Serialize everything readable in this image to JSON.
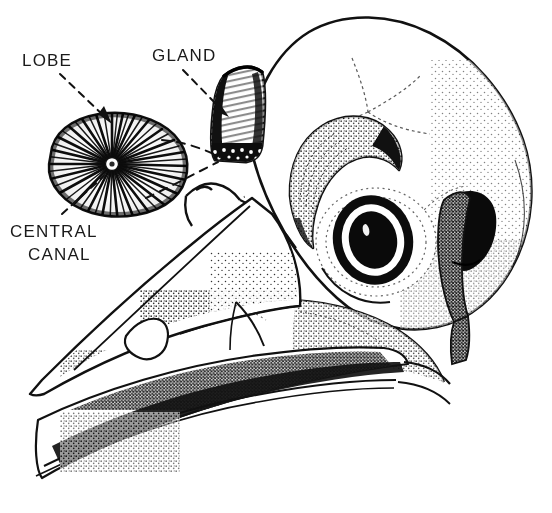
{
  "figure": {
    "background_color": "#ffffff",
    "ink_color": "#111111",
    "width": 552,
    "height": 513,
    "style": "pen-and-ink stipple scientific illustration"
  },
  "labels": {
    "lobe": "LOBE",
    "gland": "GLAND",
    "central": "CENTRAL",
    "canal": "CANAL"
  },
  "annotations": [
    {
      "name": "lobe-leader",
      "label": "LOBE",
      "type": "dashed-arrow",
      "from": [
        60,
        74
      ],
      "to": [
        110,
        120
      ],
      "target": "gland-lobe-cross-section"
    },
    {
      "name": "gland-leader",
      "label": "GLAND",
      "type": "dashed-arrow",
      "from": [
        185,
        70
      ],
      "to": [
        225,
        112
      ],
      "target": "nasal-salt-gland"
    },
    {
      "name": "central-canal-leader",
      "label": "CENTRAL CANAL",
      "type": "dashed-line",
      "from": [
        60,
        214
      ],
      "to": [
        104,
        178
      ],
      "target": "central-canal-point"
    },
    {
      "name": "lobe-to-gland-upper-link",
      "type": "dashed-line",
      "from": [
        160,
        142
      ],
      "to": [
        222,
        158
      ],
      "target": "nasal-salt-gland-base"
    },
    {
      "name": "lobe-to-gland-lower-link",
      "type": "dashed-line",
      "from": [
        148,
        196
      ],
      "to": [
        222,
        162
      ],
      "target": "nasal-salt-gland-base"
    }
  ],
  "anatomy": [
    {
      "name": "cranium",
      "description": "rounded braincase dome with suture lines"
    },
    {
      "name": "nasal-salt-gland",
      "description": "tapered supraorbital gland sitting in the nasal groove"
    },
    {
      "name": "gland-lobe-cross-section",
      "description": "ovoid section showing radiating secretory tubules"
    },
    {
      "name": "central-canal-point",
      "description": "hub at centre of radiating tubules"
    },
    {
      "name": "supraorbital-ridge",
      "description": "curved bony arch above the orbit"
    },
    {
      "name": "orbit",
      "description": "eye socket with dark sclerotic ring and pupil"
    },
    {
      "name": "quadrate",
      "description": "dark jaw articulation bone behind orbit"
    },
    {
      "name": "upper-mandible",
      "description": "long tapering upper beak with stipple shading"
    },
    {
      "name": "lower-mandible",
      "description": "lower beak with dense stipple shading"
    },
    {
      "name": "nostril-groove",
      "description": "naris opening along the upper beak"
    }
  ]
}
